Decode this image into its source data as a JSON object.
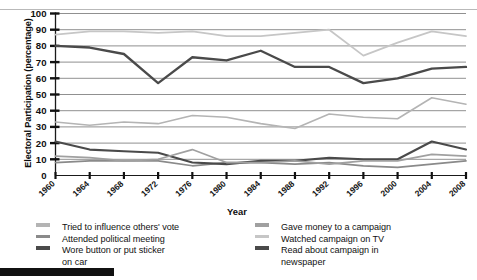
{
  "chart_data": {
    "type": "line",
    "title": "",
    "xlabel": "Year",
    "ylabel": "Electoral Participation (percentage)",
    "x": [
      1960,
      1964,
      1968,
      1972,
      1976,
      1980,
      1984,
      1988,
      1992,
      1996,
      2000,
      2004,
      2008
    ],
    "xtick_labels": [
      "1960",
      "1964",
      "1968",
      "1972",
      "1976",
      "1980",
      "1984",
      "1988",
      "1992",
      "1996",
      "2000",
      "2004",
      "2008"
    ],
    "ytick_labels": [
      "0",
      "10",
      "20",
      "30",
      "40",
      "50",
      "60",
      "70",
      "80",
      "90",
      "100"
    ],
    "ylim": [
      0,
      100
    ],
    "ytick_step": 10,
    "grid": "horizontal",
    "legend_position": "below-plot-two-columns",
    "series": [
      {
        "name": "Tried to influence others' vote",
        "color": "#b4b4b4",
        "width": 1.6,
        "values": [
          33,
          31,
          33,
          32,
          37,
          36,
          32,
          29,
          38,
          36,
          35,
          48,
          44
        ]
      },
      {
        "name": "Attended political meeting",
        "color": "#8a8a8a",
        "width": 1.7,
        "values": [
          8,
          9,
          9,
          9,
          6,
          8,
          8,
          7,
          8,
          6,
          5,
          7,
          9
        ]
      },
      {
        "name": "Wore button or put sticker on car",
        "color": "#4a4a4a",
        "width": 2.1,
        "values": [
          21,
          16,
          15,
          14,
          8,
          7,
          9,
          9,
          11,
          10,
          10,
          21,
          16
        ]
      },
      {
        "name": "Gave money to a campaign",
        "color": "#a0a0a0",
        "width": 1.7,
        "values": [
          12,
          11,
          9,
          10,
          16,
          8,
          8,
          9,
          7,
          9,
          9,
          13,
          12
        ]
      },
      {
        "name": "Watched campaign on TV",
        "color": "#c6c6c6",
        "width": 1.8,
        "values": [
          87,
          89,
          89,
          88,
          89,
          86,
          86,
          88,
          90,
          74,
          82,
          89,
          86
        ]
      },
      {
        "name": "Read about campaign in newspaper",
        "color": "#4a4a4a",
        "width": 2.3,
        "values": [
          80,
          79,
          75,
          57,
          73,
          71,
          77,
          67,
          67,
          57,
          60,
          66,
          67
        ]
      }
    ]
  },
  "axes": {
    "ylabel": "Electoral Participation (percentage)",
    "xlabel": "Year"
  },
  "legend": {
    "left_column": [
      {
        "label": "Tried to influence others' vote",
        "color": "#b4b4b4"
      },
      {
        "label": "Attended political meeting",
        "color": "#8a8a8a"
      },
      {
        "label": "Wore button or put sticker",
        "continuation": "on car",
        "color": "#4a4a4a"
      }
    ],
    "right_column": [
      {
        "label": "Gave money to a campaign",
        "color": "#a0a0a0"
      },
      {
        "label": "Watched campaign on TV",
        "color": "#c6c6c6"
      },
      {
        "label": "Read about campaign in",
        "continuation": "newspaper",
        "color": "#4a4a4a"
      }
    ]
  }
}
